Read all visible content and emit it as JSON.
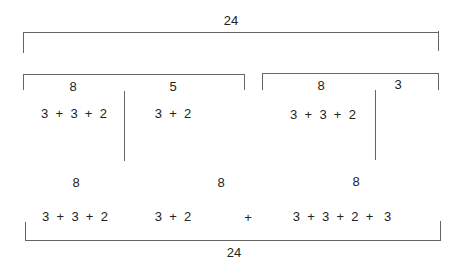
{
  "diagram": {
    "top_total": "24",
    "groups_row": {
      "left_bracket": {
        "labels": [
          "8",
          "5"
        ]
      },
      "right_bracket": {
        "labels": [
          "8",
          "3"
        ]
      }
    },
    "groupings": {
      "g1": "3  +  3  +  2",
      "g2": "3  +  2",
      "g3": "3  +  3  +  2"
    },
    "bottom_row": {
      "labels": [
        "8",
        "8",
        "8"
      ],
      "seq1": "3  +  3  +  2",
      "seq2": "3  +  2",
      "plus": "+",
      "seq3": "3  +  3  +  2  +   3",
      "total": "24"
    },
    "colors": {
      "line": "#666666",
      "text": "#222222"
    }
  }
}
